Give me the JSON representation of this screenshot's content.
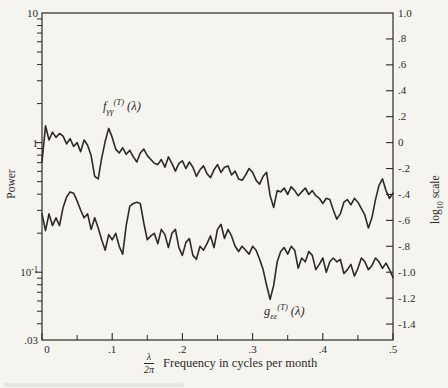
{
  "figure": {
    "background": "#f5f4ef",
    "ink": "#2d2a25"
  },
  "axes": {
    "left": {
      "title": "Power",
      "ticks": [
        {
          "label": "10",
          "log": 1.0,
          "major": true
        },
        {
          "label": "1",
          "log": 0.0,
          "major": true
        },
        {
          "base": "10",
          "sup": "-1",
          "log": -1.0,
          "major": true
        },
        {
          "label": ".03",
          "log": -1.523,
          "major": true
        }
      ]
    },
    "right": {
      "title_base": "log",
      "title_sub": "10",
      "title_rest": " scale",
      "ticks": [
        {
          "v": 1.0,
          "label": "1.0"
        },
        {
          "v": 0.8,
          "label": ".8"
        },
        {
          "v": 0.6,
          "label": ".6"
        },
        {
          "v": 0.4,
          "label": ".4"
        },
        {
          "v": 0.2,
          "label": ".2"
        },
        {
          "v": 0.0,
          "label": "0"
        },
        {
          "v": -0.2,
          "label": "-.2"
        },
        {
          "v": -0.4,
          "label": "-.4"
        },
        {
          "v": -0.6,
          "label": "-.6"
        },
        {
          "v": -0.8,
          "label": "-.8"
        },
        {
          "v": -1.0,
          "label": "-1.0"
        },
        {
          "v": -1.2,
          "label": "-1.2"
        },
        {
          "v": -1.4,
          "label": "-1.4"
        }
      ]
    },
    "bottom": {
      "fraction_num": "λ",
      "fraction_den": "2π",
      "title": "Frequency in cycles per month",
      "ticks": [
        {
          "v": 0.0,
          "label": "0"
        },
        {
          "v": 0.1,
          "label": ".1"
        },
        {
          "v": 0.2,
          "label": ".2"
        },
        {
          "v": 0.3,
          "label": ".3"
        },
        {
          "v": 0.4,
          "label": ".4"
        },
        {
          "v": 0.5,
          "label": ".5"
        }
      ],
      "minor_ticks": [
        0.05,
        0.15,
        0.25,
        0.35,
        0.45
      ]
    }
  },
  "chart_data": {
    "type": "line",
    "title": "",
    "xlabel": "λ/2π Frequency in cycles per month",
    "ylabel_left": "Power (log scale, 0.03 to 10)",
    "ylabel_right": "log10 scale",
    "x_range": [
      0,
      0.5
    ],
    "left_axis_power_range": [
      0.03,
      10
    ],
    "right_axis_log10_range": [
      -1.523,
      1.0
    ],
    "grid": false,
    "legend": "inline labels on curves",
    "x_start": 0,
    "x_step": 0.005,
    "series": [
      {
        "name": "f_γγ^(T)(λ)",
        "label_parts": {
          "base": "f",
          "sub": "γγ",
          "sup": "(T)",
          "arg": " (λ)"
        },
        "log10_values": [
          -0.15,
          0.13,
          0.02,
          0.08,
          0.04,
          0.07,
          0.05,
          -0.01,
          0.03,
          -0.03,
          0.0,
          -0.07,
          0.02,
          -0.02,
          -0.1,
          -0.26,
          -0.28,
          -0.12,
          0.01,
          0.11,
          0.04,
          -0.05,
          -0.08,
          -0.04,
          -0.09,
          -0.06,
          -0.11,
          -0.15,
          -0.08,
          -0.05,
          -0.1,
          -0.13,
          -0.16,
          -0.17,
          -0.13,
          -0.19,
          -0.11,
          -0.16,
          -0.22,
          -0.16,
          -0.14,
          -0.2,
          -0.15,
          -0.19,
          -0.26,
          -0.21,
          -0.18,
          -0.24,
          -0.27,
          -0.21,
          -0.17,
          -0.23,
          -0.19,
          -0.18,
          -0.25,
          -0.22,
          -0.28,
          -0.29,
          -0.25,
          -0.2,
          -0.23,
          -0.29,
          -0.32,
          -0.26,
          -0.23,
          -0.41,
          -0.5,
          -0.37,
          -0.38,
          -0.35,
          -0.4,
          -0.34,
          -0.37,
          -0.41,
          -0.38,
          -0.35,
          -0.4,
          -0.37,
          -0.41,
          -0.43,
          -0.47,
          -0.43,
          -0.44,
          -0.52,
          -0.59,
          -0.55,
          -0.46,
          -0.44,
          -0.48,
          -0.43,
          -0.46,
          -0.51,
          -0.56,
          -0.66,
          -0.58,
          -0.44,
          -0.33,
          -0.28,
          -0.37,
          -0.43,
          -0.39
        ]
      },
      {
        "name": "g_εε^(T)(λ)",
        "label_parts": {
          "base": "g",
          "sub": "εε",
          "sup": "(T)",
          "arg": " (λ)"
        },
        "log10_values": [
          -0.55,
          -0.68,
          -0.55,
          -0.64,
          -0.58,
          -0.64,
          -0.5,
          -0.42,
          -0.38,
          -0.39,
          -0.45,
          -0.52,
          -0.58,
          -0.55,
          -0.67,
          -0.58,
          -0.66,
          -0.75,
          -0.83,
          -0.71,
          -0.75,
          -0.7,
          -0.8,
          -0.86,
          -0.64,
          -0.49,
          -0.47,
          -0.46,
          -0.47,
          -0.62,
          -0.75,
          -0.72,
          -0.7,
          -0.78,
          -0.67,
          -0.71,
          -0.81,
          -0.7,
          -0.67,
          -0.81,
          -0.87,
          -0.77,
          -0.74,
          -0.87,
          -0.9,
          -0.8,
          -0.83,
          -0.78,
          -0.72,
          -0.81,
          -0.67,
          -0.63,
          -0.74,
          -0.67,
          -0.72,
          -0.8,
          -0.84,
          -0.8,
          -0.83,
          -0.86,
          -0.8,
          -0.83,
          -0.9,
          -0.98,
          -1.1,
          -1.21,
          -1.1,
          -0.92,
          -0.84,
          -0.81,
          -0.86,
          -0.8,
          -0.83,
          -0.97,
          -0.89,
          -0.92,
          -0.84,
          -0.87,
          -0.98,
          -0.94,
          -0.89,
          -1.0,
          -0.92,
          -0.89,
          -0.92,
          -0.9,
          -1.01,
          -0.98,
          -0.94,
          -1.03,
          -0.97,
          -0.89,
          -0.92,
          -0.98,
          -0.95,
          -0.89,
          -0.92,
          -0.97,
          -0.93,
          -0.98,
          -1.04
        ]
      }
    ]
  }
}
